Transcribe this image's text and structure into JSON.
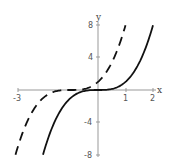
{
  "chart_data": {
    "type": "line",
    "title": "",
    "xlabel": "x",
    "ylabel": "y",
    "xlim": [
      -3,
      2
    ],
    "ylim": [
      -8,
      8
    ],
    "x_ticks": [
      -3,
      1,
      2
    ],
    "x_tick_labels": [
      "-3",
      "1",
      "2"
    ],
    "y_ticks": [
      8,
      4,
      -4,
      -8
    ],
    "y_tick_labels": [
      "8",
      "4",
      "-4",
      "-8"
    ],
    "grid": false,
    "legend": null,
    "series": [
      {
        "name": "y = x^3",
        "style": "solid",
        "color": "#111111",
        "x": [
          -2,
          -1.5,
          -1,
          -0.5,
          0,
          0.5,
          1,
          1.5,
          2
        ],
        "values": [
          -8,
          -3.375,
          -1,
          -0.125,
          0,
          0.125,
          1,
          3.375,
          8
        ]
      },
      {
        "name": "y = (x+1)^3",
        "style": "dashed",
        "color": "#111111",
        "x": [
          -3,
          -2.5,
          -2,
          -1.5,
          -1,
          -0.5,
          0,
          0.5,
          1
        ],
        "values": [
          -8,
          -3.375,
          -1,
          -0.125,
          0,
          0.125,
          1,
          3.375,
          8
        ]
      }
    ]
  },
  "labels": {
    "x_axis": "x",
    "y_axis": "y",
    "x_tick_neg3": "-3",
    "x_tick_1": "1",
    "x_tick_2": "2",
    "y_tick_8": "8",
    "y_tick_4": "4",
    "y_tick_neg4": "-4",
    "y_tick_neg8": "-8"
  }
}
